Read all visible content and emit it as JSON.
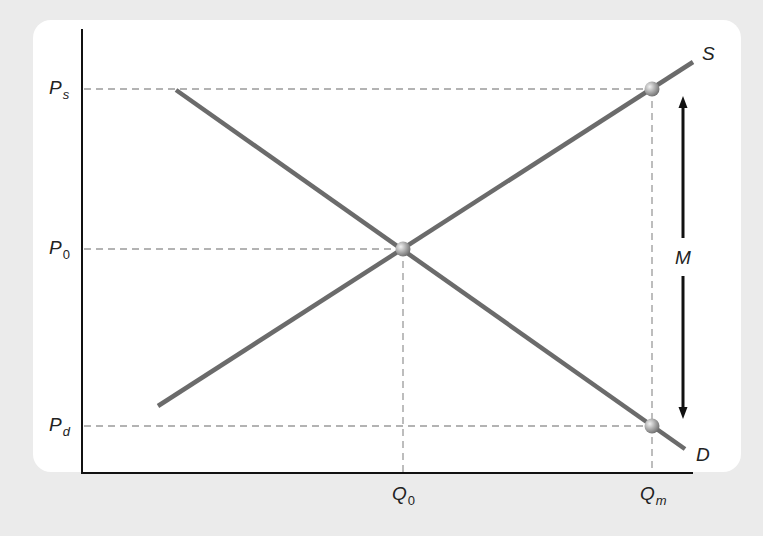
{
  "diagram": {
    "type": "supply-demand-price-wedge",
    "colors": {
      "background": "#ebebeb",
      "panel": "#ffffff",
      "curve": "#6b6b6b",
      "axis": "#111111",
      "guide": "#9a9a9a",
      "point": "#9c9c9c",
      "arrow": "#111111"
    },
    "curves": {
      "supply": {
        "label": "S",
        "from": [
          158,
          406
        ],
        "to": [
          693,
          62
        ]
      },
      "demand": {
        "label": "D",
        "from": [
          176,
          90
        ],
        "to": [
          685,
          449
        ]
      }
    },
    "y_axis_labels": [
      {
        "id": "ps",
        "main": "P",
        "sub": "s",
        "y": 89
      },
      {
        "id": "p0",
        "main": "P",
        "sub": "0",
        "y": 249
      },
      {
        "id": "pd",
        "main": "P",
        "sub": "d",
        "y": 426
      }
    ],
    "x_axis_labels": [
      {
        "id": "q0",
        "main": "Q",
        "sub": "0",
        "x": 403
      },
      {
        "id": "qm",
        "main": "Q",
        "sub": "m",
        "x": 652
      }
    ],
    "points": [
      {
        "id": "supply-price-point",
        "x": 652,
        "y": 89
      },
      {
        "id": "equilibrium-point",
        "x": 403,
        "y": 249
      },
      {
        "id": "demand-price-point",
        "x": 652,
        "y": 426
      }
    ],
    "wedge": {
      "label": "M",
      "x": 683,
      "top": 97,
      "bottom": 418
    }
  }
}
